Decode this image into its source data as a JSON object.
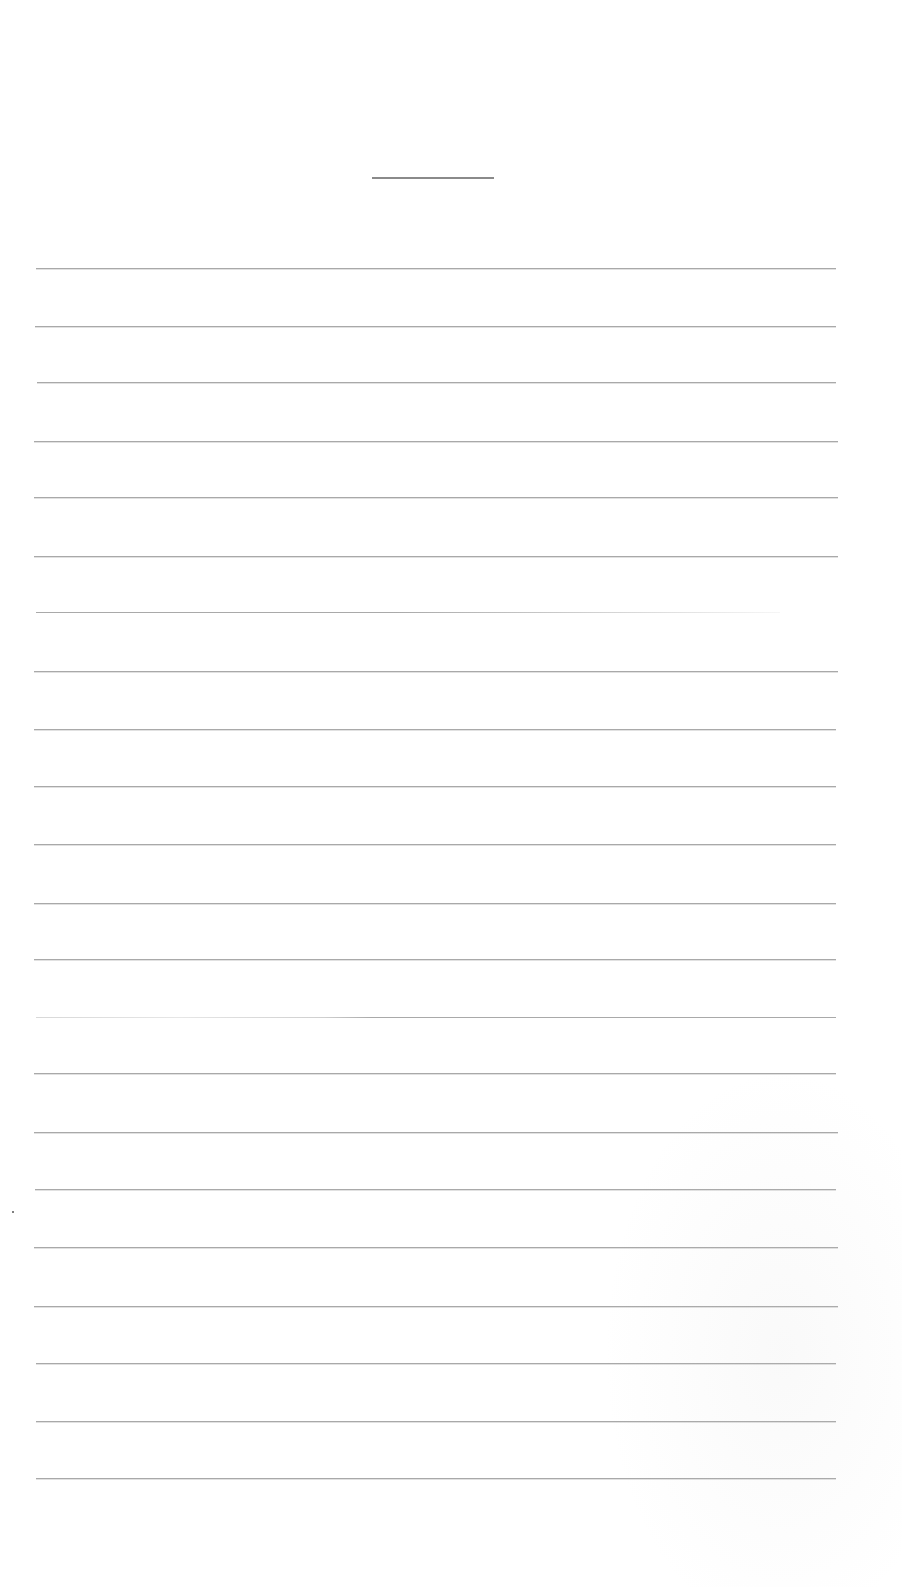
{
  "page": {
    "type": "blank lined writing paper",
    "background_color": "#ffffff",
    "line_color": "#a9a9a9",
    "title_rule": {
      "x1": 372,
      "x2": 494,
      "y": 177
    },
    "writing_lines": [
      {
        "y": 268,
        "x1": 36,
        "x2": 836,
        "style": "solid"
      },
      {
        "y": 326,
        "x1": 35,
        "x2": 836,
        "style": "solid"
      },
      {
        "y": 382,
        "x1": 37,
        "x2": 836,
        "style": "solid"
      },
      {
        "y": 441,
        "x1": 34,
        "x2": 838,
        "style": "solid"
      },
      {
        "y": 497,
        "x1": 34,
        "x2": 838,
        "style": "solid"
      },
      {
        "y": 556,
        "x1": 34,
        "x2": 838,
        "style": "solid"
      },
      {
        "y": 612,
        "x1": 36,
        "x2": 780,
        "style": "faded"
      },
      {
        "y": 671,
        "x1": 34,
        "x2": 838,
        "style": "solid"
      },
      {
        "y": 729,
        "x1": 34,
        "x2": 836,
        "style": "solid"
      },
      {
        "y": 786,
        "x1": 34,
        "x2": 836,
        "style": "solid"
      },
      {
        "y": 844,
        "x1": 34,
        "x2": 836,
        "style": "solid"
      },
      {
        "y": 903,
        "x1": 34,
        "x2": 836,
        "style": "solid"
      },
      {
        "y": 959,
        "x1": 34,
        "x2": 836,
        "style": "solid"
      },
      {
        "y": 1017,
        "x1": 36,
        "x2": 836,
        "style": "faded-start"
      },
      {
        "y": 1073,
        "x1": 34,
        "x2": 836,
        "style": "solid"
      },
      {
        "y": 1132,
        "x1": 34,
        "x2": 838,
        "style": "solid"
      },
      {
        "y": 1189,
        "x1": 35,
        "x2": 836,
        "style": "solid"
      },
      {
        "y": 1247,
        "x1": 34,
        "x2": 838,
        "style": "solid"
      },
      {
        "y": 1306,
        "x1": 34,
        "x2": 838,
        "style": "solid"
      },
      {
        "y": 1363,
        "x1": 36,
        "x2": 836,
        "style": "solid"
      },
      {
        "y": 1421,
        "x1": 36,
        "x2": 836,
        "style": "solid"
      },
      {
        "y": 1478,
        "x1": 36,
        "x2": 836,
        "style": "solid"
      }
    ],
    "stray_mark": {
      "x": 12,
      "y": 1211
    }
  }
}
